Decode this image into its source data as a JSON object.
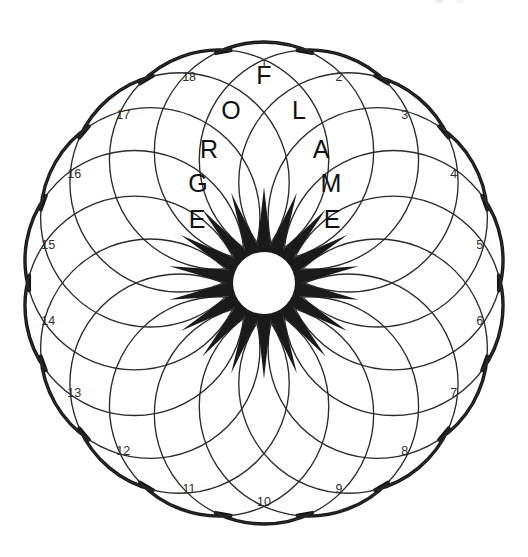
{
  "figure": {
    "shape_name": "eighteen-petal rosette",
    "petal_count": 18,
    "ring_count": 5,
    "center_x": 264,
    "center_y": 283,
    "outer_radius": 241,
    "hub_radius": 31,
    "star_outer_radius": 96,
    "colors": {
      "outline": "#161616",
      "lattice": "#2a2a2a",
      "star_fill": "#1a1a1a",
      "hub_fill": "#ffffff",
      "background": "#ffffff",
      "letter": "#111111",
      "number": "#2f2f2f"
    }
  },
  "petal_numbers": [
    {
      "label": "1",
      "angle_deg": 0
    },
    {
      "label": "2",
      "angle_deg": 20
    },
    {
      "label": "3",
      "angle_deg": 40
    },
    {
      "label": "4",
      "angle_deg": 60
    },
    {
      "label": "5",
      "angle_deg": 80
    },
    {
      "label": "6",
      "angle_deg": 100
    },
    {
      "label": "7",
      "angle_deg": 120
    },
    {
      "label": "8",
      "angle_deg": 140
    },
    {
      "label": "9",
      "angle_deg": 160
    },
    {
      "label": "10",
      "angle_deg": 180
    },
    {
      "label": "11",
      "angle_deg": 200
    },
    {
      "label": "12",
      "angle_deg": 220
    },
    {
      "label": "13",
      "angle_deg": 240
    },
    {
      "label": "14",
      "angle_deg": 260
    },
    {
      "label": "15",
      "angle_deg": 280
    },
    {
      "label": "16",
      "angle_deg": 300
    },
    {
      "label": "17",
      "angle_deg": 320
    },
    {
      "label": "18",
      "angle_deg": 340
    }
  ],
  "answers": [
    {
      "word": "FORGE",
      "direction": "down-left",
      "start_petal": "1",
      "letters": [
        {
          "char": "F",
          "ring": 1,
          "x": 264,
          "y": 75
        },
        {
          "char": "O",
          "ring": 2,
          "x": 231,
          "y": 110
        },
        {
          "char": "R",
          "ring": 3,
          "x": 209,
          "y": 149
        },
        {
          "char": "G",
          "ring": 4,
          "x": 198,
          "y": 183
        },
        {
          "char": "E",
          "ring": 5,
          "x": 197,
          "y": 219
        }
      ]
    },
    {
      "word": "FLAME",
      "direction": "down-right",
      "start_petal": "1",
      "letters": [
        {
          "char": "L",
          "ring": 2,
          "x": 299,
          "y": 110
        },
        {
          "char": "A",
          "ring": 3,
          "x": 321,
          "y": 149
        },
        {
          "char": "M",
          "ring": 4,
          "x": 331,
          "y": 183
        },
        {
          "char": "E",
          "ring": 5,
          "x": 332,
          "y": 219
        }
      ]
    }
  ]
}
